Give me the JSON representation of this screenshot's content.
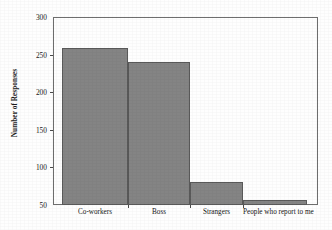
{
  "chart_data": {
    "type": "bar",
    "title": "",
    "subtitle": "",
    "xlabel": "",
    "ylabel": "Number of Responses",
    "categories": [
      "Co-workers",
      "Boss",
      "Strangers",
      "People who report to me"
    ],
    "values": [
      259,
      240,
      80,
      56
    ],
    "series": [
      {
        "name": "Number of Responses",
        "values": [
          259,
          240,
          80,
          56
        ]
      }
    ],
    "ylim": [
      50,
      300
    ],
    "yticks": [
      50,
      100,
      150,
      200,
      250,
      300
    ],
    "ytick_labels": [
      "50",
      "100",
      "150",
      "200",
      "250",
      "300"
    ],
    "xtick_labels": [
      "Co-workers",
      "Boss",
      "Strangers",
      "People who report to me"
    ],
    "grid": false,
    "legend": false,
    "legend_position": "none",
    "annotations": [],
    "colors": {
      "bar_fill": "#848484",
      "bar_edge": "#595959",
      "axis": "#6e6e6e",
      "text": "#141414",
      "background": "#fefefe"
    }
  },
  "axes": {
    "y_title": "Number of Responses",
    "y_ticks": [
      {
        "label": "300",
        "value": 300
      },
      {
        "label": "250",
        "value": 250
      },
      {
        "label": "200",
        "value": 200
      },
      {
        "label": "150",
        "value": 150
      },
      {
        "label": "100",
        "value": 100
      },
      {
        "label": "50",
        "value": 50
      }
    ]
  },
  "bars": [
    {
      "label": "Co-workers",
      "value": 259
    },
    {
      "label": "Boss",
      "value": 240
    },
    {
      "label": "Strangers",
      "value": 80
    },
    {
      "label": "People who report to me",
      "value": 56
    }
  ]
}
